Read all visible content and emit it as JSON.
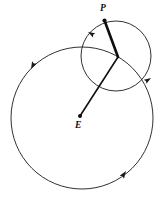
{
  "figure": {
    "background_color": "#ffffff",
    "line_color": "#1a1a1a",
    "width": 163,
    "height": 198
  },
  "labels": {
    "planet": "P",
    "earth": "E"
  },
  "points": {
    "planet": {
      "name": "P",
      "x": 104,
      "y": 20
    },
    "earth": {
      "name": "E",
      "x": 80,
      "y": 116
    },
    "epicycle_center": {
      "name": "C",
      "x": 118,
      "y": 57
    }
  },
  "circles": [
    {
      "name": "deferent",
      "cx": 82,
      "cy": 118,
      "r": 71,
      "stroke": "#1a1a1a",
      "stroke_width": 0.9,
      "direction": "counterclockwise"
    },
    {
      "name": "epicycle",
      "cx": 116,
      "cy": 56,
      "r": 35,
      "stroke": "#1a1a1a",
      "stroke_width": 0.9,
      "direction": "counterclockwise"
    }
  ],
  "lines": [
    {
      "name": "earth-to-center-radius",
      "from": "E",
      "to": "C",
      "stroke": "#111111",
      "stroke_width": 1.6
    },
    {
      "name": "center-to-planet-radius",
      "from": "C",
      "to": "P",
      "stroke": "#0d0d0d",
      "stroke_width": 2.6
    }
  ],
  "arrow_markers": [
    {
      "name": "deferent-upper-left-arrow",
      "x": 31,
      "y": 69,
      "angle": 117
    },
    {
      "name": "deferent-lower-right-arrow",
      "x": 126,
      "y": 171,
      "angle": -56
    },
    {
      "name": "epicycle-upper-left-arrow",
      "x": 88,
      "y": 32,
      "angle": 208
    },
    {
      "name": "epicycle-right-arrow",
      "x": 150,
      "y": 78,
      "angle": -33
    }
  ]
}
